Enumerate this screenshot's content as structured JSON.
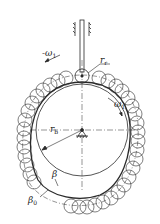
{
  "diagram": {
    "type": "roller follower disk cam – envelope of roller positions",
    "labels": {
      "omega_top": "-ω",
      "omega_top_sub": "1",
      "omega_right": "ω",
      "omega_right_sub": "1",
      "roller_radius": "r",
      "roller_radius_sub": "r",
      "base_radius": "r",
      "base_radius_sub": "b",
      "actual_profile": "β",
      "pitch_profile": "β",
      "pitch_profile_sub": "0"
    },
    "colors": {
      "line": "#2a2a2a",
      "background": "#ffffff"
    }
  }
}
